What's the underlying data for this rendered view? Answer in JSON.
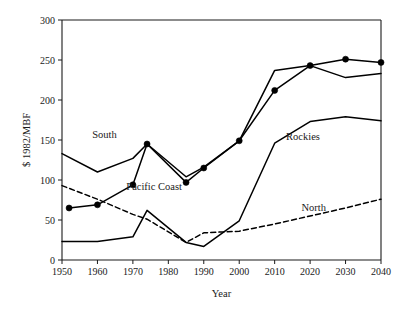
{
  "chart_data": {
    "type": "line",
    "title": "",
    "xlabel": "Year",
    "ylabel": "$ 1982/MBF",
    "xlim": [
      1950,
      2040
    ],
    "ylim": [
      0,
      300
    ],
    "xticks": [
      1950,
      1960,
      1970,
      1980,
      1990,
      2000,
      2010,
      2020,
      2030,
      2040
    ],
    "yticks": [
      0,
      50,
      100,
      150,
      200,
      250,
      300
    ],
    "xtick_labels": [
      "1950",
      "1960",
      "1970",
      "1980",
      "1990",
      "2000",
      "2010",
      "2020",
      "2030",
      "2040"
    ],
    "ytick_labels": [
      "0",
      "50",
      "100",
      "150",
      "200",
      "250",
      "300"
    ],
    "grid": false,
    "legend": "inline-annotations",
    "series": [
      {
        "name": "South",
        "style": "solid",
        "markers": false,
        "label_text": "South",
        "label_x": 1962,
        "label_y": 152,
        "x": [
          1950,
          1960,
          1970,
          1974,
          1985,
          1990,
          2000,
          2010,
          2020,
          2030,
          2040
        ],
        "y": [
          133,
          110,
          127,
          145,
          104,
          116,
          149,
          237,
          243,
          228,
          233
        ]
      },
      {
        "name": "Pacific Coast",
        "style": "solid",
        "markers": true,
        "label_text": "Pacific Coast",
        "label_x": 1976,
        "label_y": 88,
        "x": [
          1952,
          1960,
          1970,
          1974,
          1985,
          1990,
          2000,
          2010,
          2020,
          2030,
          2040
        ],
        "y": [
          65,
          69,
          94,
          145,
          97,
          115,
          149,
          212,
          243,
          251,
          247
        ]
      },
      {
        "name": "Rockies",
        "style": "solid",
        "markers": false,
        "label_text": "Rockies",
        "label_x": 2018,
        "label_y": 150,
        "x": [
          1950,
          1960,
          1970,
          1974,
          1985,
          1990,
          2000,
          2010,
          2020,
          2030,
          2040
        ],
        "y": [
          23,
          23,
          29,
          62,
          22,
          17,
          49,
          146,
          173,
          179,
          174
        ]
      },
      {
        "name": "North",
        "style": "dashed",
        "markers": false,
        "label_text": "North",
        "label_x": 2021,
        "label_y": 61,
        "x": [
          1950,
          1960,
          1970,
          1974,
          1985,
          1990,
          2000,
          2010,
          2020,
          2030,
          2040
        ],
        "y": [
          93,
          76,
          57,
          51,
          22,
          34,
          36,
          45,
          55,
          65,
          76
        ]
      }
    ]
  },
  "colors": {
    "line": "#000000",
    "axis": "#1a1a1a",
    "background": "#ffffff"
  }
}
